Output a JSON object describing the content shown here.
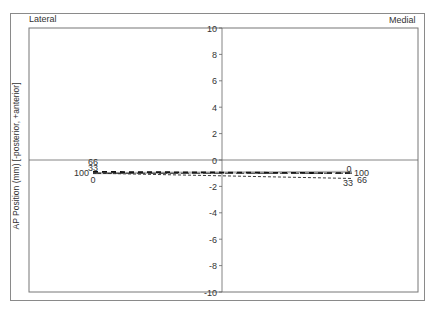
{
  "chart_data": {
    "type": "line",
    "title": "",
    "xlabel": "",
    "ylabel": "AP Position (mm) [-posterior, +anterior]",
    "ylim": [
      -10,
      10
    ],
    "yticks": [
      10,
      8,
      6,
      4,
      2,
      0,
      -2,
      -4,
      -6,
      -8,
      -10
    ],
    "corner_labels": {
      "left": "Lateral",
      "right": "Medial"
    },
    "categories": [
      "Lateral",
      "Medial"
    ],
    "series": [
      {
        "name": "0",
        "style": "solid-gray",
        "values": [
          -1.0,
          -0.9
        ]
      },
      {
        "name": "33",
        "style": "dashed-fine",
        "values": [
          -1.0,
          -1.4
        ]
      },
      {
        "name": "66",
        "style": "dashed-bold",
        "values": [
          -0.9,
          -1.0
        ]
      },
      {
        "name": "100",
        "style": "dashed-long",
        "values": [
          -1.0,
          -1.0
        ]
      }
    ],
    "end_labels": {
      "left": [
        {
          "text": "66",
          "pos": "above"
        },
        {
          "text": "33",
          "pos": "above2"
        },
        {
          "text": "100",
          "pos": "left"
        },
        {
          "text": "0",
          "pos": "below"
        }
      ],
      "right": [
        {
          "text": "0",
          "pos": "above"
        },
        {
          "text": "100",
          "pos": "right"
        },
        {
          "text": "66",
          "pos": "right2"
        },
        {
          "text": "33",
          "pos": "below"
        }
      ]
    },
    "grid": false,
    "legend": "none"
  }
}
